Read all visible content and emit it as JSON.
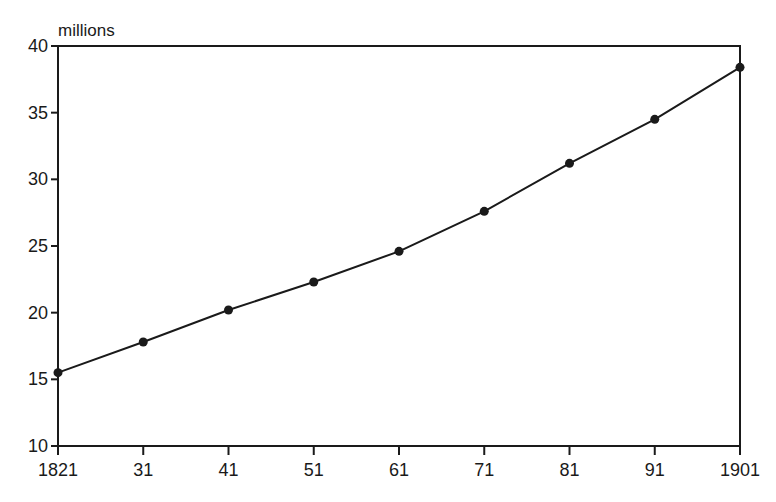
{
  "chart_data": {
    "type": "line",
    "title": "",
    "xlabel": "",
    "ylabel": "millions",
    "x": [
      "1821",
      "31",
      "41",
      "51",
      "61",
      "71",
      "81",
      "91",
      "1901"
    ],
    "x_years": [
      1821,
      1831,
      1841,
      1851,
      1861,
      1871,
      1881,
      1891,
      1901
    ],
    "series": [
      {
        "name": "Population",
        "values": [
          15.5,
          17.8,
          20.2,
          22.3,
          24.6,
          27.6,
          31.2,
          34.5,
          38.4
        ]
      }
    ],
    "ylim": [
      10,
      40
    ],
    "yticks": [
      10,
      15,
      20,
      25,
      30,
      35,
      40
    ],
    "ytick_labels": [
      "10",
      "15",
      "20",
      "25",
      "30",
      "35",
      "40"
    ],
    "grid": false,
    "legend": null,
    "markers": "filled-circle",
    "colors": {
      "line": "#1a1a1a",
      "axis": "#1a1a1a",
      "background": "#ffffff"
    }
  }
}
